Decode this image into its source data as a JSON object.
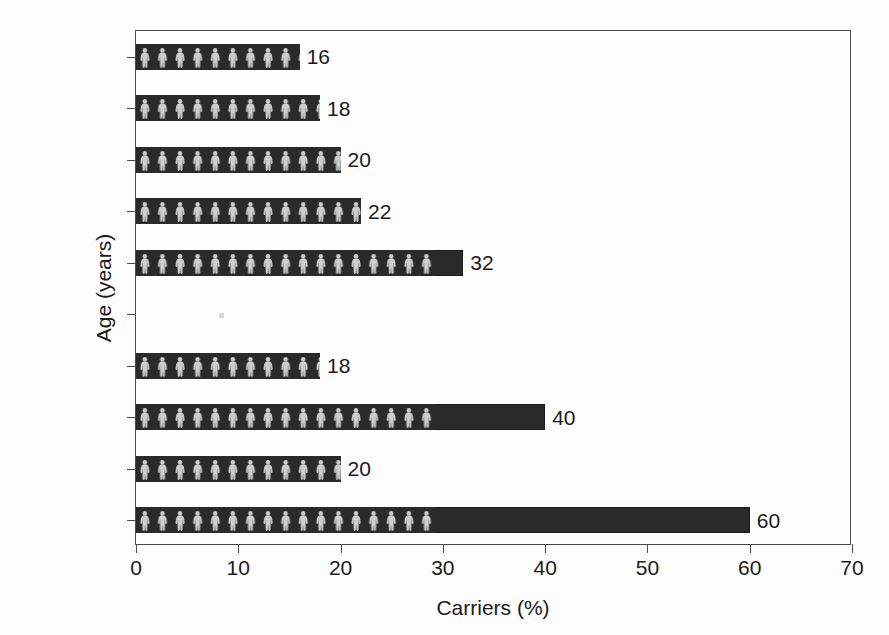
{
  "chart_data": {
    "type": "bar",
    "orientation": "horizontal",
    "title": "",
    "xlabel": "Carriers (%)",
    "ylabel": "Age (years)",
    "categories": [
      "0–1",
      "1–10",
      "10–20",
      "20–30",
      "30–40",
      "40–50",
      "50–60",
      "60–70",
      "70–80",
      ">80"
    ],
    "values": [
      60,
      20,
      40,
      18,
      0,
      32,
      22,
      20,
      18,
      16
    ],
    "bar_labels": [
      "60",
      "20",
      "40",
      "18",
      "",
      "32",
      "22",
      "20",
      "18",
      "16"
    ],
    "xlim": [
      0,
      70
    ],
    "xticks": [
      0,
      10,
      20,
      30,
      40,
      50,
      60,
      70
    ],
    "xtick_labels": [
      "0",
      "10",
      "20",
      "30",
      "40",
      "50",
      "60",
      "70"
    ],
    "grid": false,
    "legend": null,
    "bar_fill_pattern": "human-figure-silhouettes",
    "bar_color": "#2a2a2a",
    "figure_color": "#d9d9d9",
    "axis_color": "#4a4a4a",
    "background_color": "#fdfdfd"
  }
}
